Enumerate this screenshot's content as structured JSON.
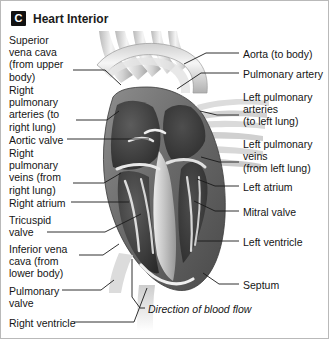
{
  "figure": {
    "panel_letter": "C",
    "title": "Heart Interior",
    "background_color": "#ffffff",
    "border_color": "#b9b9b9",
    "line_color": "#1a1a1a"
  },
  "labels_left": [
    {
      "name": "superior-vena-cava",
      "text": "Superior\nvena cava\n(from upper\nbody)",
      "x": 8,
      "y": 33,
      "leader": [
        [
          72,
          69
        ],
        [
          104,
          69
        ],
        [
          120,
          84
        ]
      ]
    },
    {
      "name": "right-pulmonary-arteries",
      "text": "Right\npulmonary\narteries (to\nright lung)",
      "x": 8,
      "y": 83,
      "leader": [
        [
          75,
          119
        ],
        [
          106,
          119
        ],
        [
          118,
          110
        ]
      ]
    },
    {
      "name": "aortic-valve",
      "text": "Aortic valve",
      "x": 8,
      "y": 133,
      "leader": [
        [
          66,
          138
        ],
        [
          148,
          138
        ]
      ]
    },
    {
      "name": "right-pulmonary-veins",
      "text": "Right\npulmonary\nveins (from\nright lung)",
      "x": 8,
      "y": 146,
      "leader": [
        [
          72,
          182
        ],
        [
          103,
          182
        ],
        [
          120,
          172
        ]
      ]
    },
    {
      "name": "right-atrium",
      "text": "Right atrium",
      "x": 8,
      "y": 196,
      "leader": [
        [
          70,
          201
        ],
        [
          128,
          201
        ]
      ]
    },
    {
      "name": "tricuspid-valve",
      "text": "Tricuspid\nvalve",
      "x": 8,
      "y": 213,
      "leader": [
        [
          46,
          231
        ],
        [
          104,
          231
        ],
        [
          140,
          213
        ]
      ]
    },
    {
      "name": "inferior-vena-cava",
      "text": "Inferior vena\ncava (from\nlower body)",
      "x": 8,
      "y": 242,
      "leader": [
        [
          78,
          254
        ],
        [
          102,
          254
        ],
        [
          118,
          243
        ]
      ]
    },
    {
      "name": "pulmonary-valve",
      "text": "Pulmonary\nvalve",
      "x": 8,
      "y": 284,
      "leader": [
        [
          61,
          289
        ],
        [
          100,
          289
        ],
        [
          113,
          279
        ]
      ]
    },
    {
      "name": "right-ventricle",
      "text": "Right ventricle",
      "x": 8,
      "y": 316,
      "leader": [
        [
          73,
          321
        ],
        [
          133,
          321
        ],
        [
          146,
          287
        ]
      ]
    }
  ],
  "labels_right": [
    {
      "name": "aorta",
      "text": "Aorta (to body)",
      "x": 242,
      "y": 47,
      "leader": [
        [
          238,
          52
        ],
        [
          205,
          52
        ],
        [
          183,
          63
        ]
      ]
    },
    {
      "name": "pulmonary-artery",
      "text": "Pulmonary artery",
      "x": 242,
      "y": 67,
      "leader": [
        [
          238,
          72
        ],
        [
          200,
          72
        ],
        [
          176,
          88
        ]
      ]
    },
    {
      "name": "left-pulmonary-arteries",
      "text": "Left pulmonary\narteries\n(to left lung)",
      "x": 242,
      "y": 90,
      "leader": [
        [
          238,
          114
        ],
        [
          216,
          114
        ],
        [
          199,
          110
        ]
      ]
    },
    {
      "name": "left-pulmonary-veins",
      "text": "Left pulmonary\nveins\n(from left lung)",
      "x": 242,
      "y": 137,
      "leader": [
        [
          238,
          161
        ],
        [
          218,
          161
        ],
        [
          200,
          156
        ]
      ]
    },
    {
      "name": "left-atrium",
      "text": "Left atrium",
      "x": 242,
      "y": 180,
      "leader": [
        [
          238,
          185
        ],
        [
          214,
          185
        ],
        [
          196,
          178
        ]
      ]
    },
    {
      "name": "mitral-valve",
      "text": "Mitral valve",
      "x": 242,
      "y": 205,
      "leader": [
        [
          238,
          210
        ],
        [
          214,
          210
        ],
        [
          193,
          200
        ]
      ]
    },
    {
      "name": "left-ventricle",
      "text": "Left ventricle",
      "x": 242,
      "y": 235,
      "leader": [
        [
          238,
          240
        ],
        [
          196,
          240
        ]
      ]
    },
    {
      "name": "septum",
      "text": "Septum",
      "x": 242,
      "y": 278,
      "leader": [
        [
          238,
          283
        ],
        [
          218,
          283
        ],
        [
          202,
          272
        ]
      ]
    }
  ],
  "caption": {
    "name": "direction-of-blood-flow",
    "text": "Direction of blood flow",
    "x": 147,
    "y": 302,
    "leader": [
      [
        144,
        307
      ],
      [
        139,
        307
      ],
      [
        131,
        296
      ],
      [
        131,
        258
      ]
    ]
  }
}
